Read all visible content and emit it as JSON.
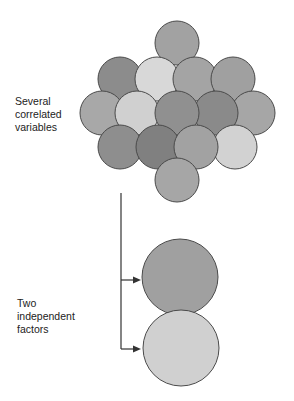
{
  "labels": {
    "top": [
      "Several",
      "correlated",
      "variables"
    ],
    "bottom": [
      "Two",
      "independent",
      "factors"
    ]
  },
  "diagram": {
    "cluster_circles": [
      {
        "cx": 177,
        "cy": 43,
        "r": 22,
        "fill": "#a2a2a2"
      },
      {
        "cx": 120,
        "cy": 79,
        "r": 22,
        "fill": "#8c8c8c"
      },
      {
        "cx": 157,
        "cy": 79,
        "r": 22,
        "fill": "#d8d8d8"
      },
      {
        "cx": 195,
        "cy": 79,
        "r": 22,
        "fill": "#a4a4a4"
      },
      {
        "cx": 233,
        "cy": 79,
        "r": 22,
        "fill": "#a0a0a0"
      },
      {
        "cx": 102,
        "cy": 113,
        "r": 22,
        "fill": "#a8a8a8"
      },
      {
        "cx": 137,
        "cy": 113,
        "r": 22,
        "fill": "#d0d0d0"
      },
      {
        "cx": 253,
        "cy": 113,
        "r": 22,
        "fill": "#a6a6a6"
      },
      {
        "cx": 216,
        "cy": 113,
        "r": 22,
        "fill": "#8a8a8a"
      },
      {
        "cx": 177,
        "cy": 113,
        "r": 22,
        "fill": "#909090"
      },
      {
        "cx": 120,
        "cy": 147,
        "r": 22,
        "fill": "#8e8e8e"
      },
      {
        "cx": 235,
        "cy": 147,
        "r": 22,
        "fill": "#d2d2d2"
      },
      {
        "cx": 158,
        "cy": 147,
        "r": 22,
        "fill": "#808080"
      },
      {
        "cx": 196,
        "cy": 147,
        "r": 22,
        "fill": "#a2a2a2"
      },
      {
        "cx": 177,
        "cy": 180,
        "r": 22,
        "fill": "#a6a6a6"
      }
    ],
    "factor_circles": [
      {
        "cx": 180,
        "cy": 277,
        "r": 38,
        "fill": "#a0a0a0"
      },
      {
        "cx": 181,
        "cy": 348,
        "r": 38,
        "fill": "#d0d0d0"
      }
    ],
    "stroke": "#4a4a4a",
    "connector": {
      "x": 121,
      "y_start": 193,
      "y_end": 349,
      "arrows_y": [
        280,
        349
      ],
      "arrow_tip_x": 141
    }
  }
}
